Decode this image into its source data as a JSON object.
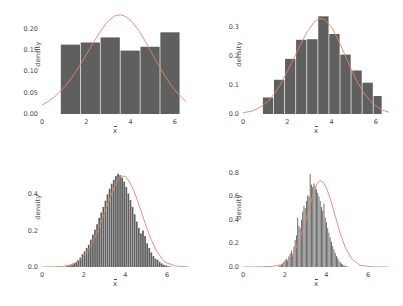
{
  "figure": {
    "background_color": "#ffffff",
    "bar_color": "#5f5f5f",
    "curve_color": "#e8836b",
    "text_color": "#4a4a4a",
    "panel_count": 4
  },
  "chart_data": [
    {
      "type": "bar",
      "panel": "top-left",
      "title": "",
      "subtitle": "",
      "xlabel": "x̄",
      "ylabel": "density",
      "grid": false,
      "legend": null,
      "xlim": [
        0,
        6.6
      ],
      "ylim": [
        0,
        0.235
      ],
      "xticks": [
        0,
        2,
        4,
        6
      ],
      "xticklabels": [
        "0",
        "2",
        "4",
        "6"
      ],
      "yticks": [
        0.0,
        0.05,
        0.1,
        0.15,
        0.2
      ],
      "yticklabels": [
        "0.00",
        "0.05",
        "0.10",
        "0.15",
        "0.20"
      ],
      "bin_edges": [
        0.85,
        1.75,
        2.65,
        3.55,
        4.45,
        5.35,
        6.25
      ],
      "values": [
        0.163,
        0.168,
        0.18,
        0.149,
        0.158,
        0.192
      ],
      "series": [
        {
          "name": "normal density curve",
          "type": "line",
          "x": [
            0.0,
            0.3,
            0.6,
            0.9,
            1.2,
            1.5,
            1.8,
            2.1,
            2.4,
            2.7,
            3.0,
            3.3,
            3.55,
            3.8,
            4.1,
            4.4,
            4.7,
            5.0,
            5.3,
            5.6,
            5.9,
            6.2,
            6.5
          ],
          "y": [
            0.021,
            0.03,
            0.042,
            0.057,
            0.075,
            0.097,
            0.122,
            0.148,
            0.174,
            0.199,
            0.219,
            0.231,
            0.233,
            0.229,
            0.215,
            0.194,
            0.168,
            0.14,
            0.112,
            0.086,
            0.063,
            0.045,
            0.03
          ]
        }
      ]
    },
    {
      "type": "bar",
      "panel": "top-right",
      "title": "",
      "subtitle": "",
      "xlabel": "x̄",
      "ylabel": "density",
      "grid": false,
      "legend": null,
      "xlim": [
        0,
        6.6
      ],
      "ylim": [
        0,
        0.345
      ],
      "xticks": [
        0,
        2,
        4,
        6
      ],
      "xticklabels": [
        "0",
        "2",
        "4",
        "6"
      ],
      "yticks": [
        0.0,
        0.1,
        0.2,
        0.3
      ],
      "yticklabels": [
        "0.0",
        "0.1",
        "0.2",
        "0.3"
      ],
      "bin_edges": [
        0.9,
        1.4,
        1.9,
        2.4,
        2.9,
        3.4,
        3.9,
        4.4,
        4.9,
        5.4,
        5.9,
        6.3
      ],
      "values": [
        0.057,
        0.118,
        0.19,
        0.256,
        0.258,
        0.337,
        0.276,
        0.205,
        0.15,
        0.108,
        0.062
      ],
      "series": [
        {
          "name": "normal density curve",
          "type": "line",
          "x": [
            0.0,
            0.4,
            0.8,
            1.1,
            1.4,
            1.7,
            2.0,
            2.3,
            2.6,
            2.9,
            3.2,
            3.45,
            3.7,
            4.0,
            4.3,
            4.6,
            4.9,
            5.2,
            5.5,
            5.9,
            6.3,
            6.6
          ],
          "y": [
            0.004,
            0.01,
            0.024,
            0.042,
            0.068,
            0.103,
            0.146,
            0.193,
            0.24,
            0.283,
            0.316,
            0.33,
            0.326,
            0.3,
            0.256,
            0.205,
            0.153,
            0.106,
            0.069,
            0.033,
            0.013,
            0.006
          ]
        }
      ]
    },
    {
      "type": "bar",
      "panel": "bottom-left",
      "title": "",
      "subtitle": "",
      "xlabel": "x̄",
      "ylabel": "density",
      "grid": false,
      "legend": null,
      "xlim": [
        0,
        7.0
      ],
      "ylim": [
        0,
        0.55
      ],
      "xticks": [
        0,
        2,
        4,
        6
      ],
      "xticklabels": [
        "0",
        "2",
        "4",
        "6"
      ],
      "yticks": [
        0.0,
        0.2,
        0.4
      ],
      "yticklabels": [
        "0.0",
        "0.2",
        "0.4"
      ],
      "bin_width": 0.1,
      "bin_start": 1.1,
      "values": [
        0.004,
        0.006,
        0.009,
        0.013,
        0.02,
        0.027,
        0.038,
        0.052,
        0.07,
        0.086,
        0.105,
        0.122,
        0.15,
        0.178,
        0.205,
        0.235,
        0.27,
        0.3,
        0.33,
        0.365,
        0.4,
        0.43,
        0.458,
        0.48,
        0.5,
        0.512,
        0.505,
        0.492,
        0.47,
        0.44,
        0.405,
        0.368,
        0.33,
        0.29,
        0.25,
        0.215,
        0.185,
        0.2,
        0.17,
        0.13,
        0.105,
        0.08,
        0.06,
        0.046,
        0.04,
        0.028,
        0.019,
        0.012,
        0.008,
        0.005,
        0.003
      ],
      "series": [
        {
          "name": "normal density curve",
          "type": "line",
          "x": [
            0.0,
            0.6,
            1.0,
            1.3,
            1.6,
            1.9,
            2.1,
            2.3,
            2.5,
            2.7,
            2.9,
            3.1,
            3.3,
            3.5,
            3.65,
            3.8,
            4.0,
            4.2,
            4.4,
            4.6,
            4.8,
            5.0,
            5.2,
            5.5,
            5.9,
            6.4,
            7.0
          ],
          "y": [
            0.0,
            0.001,
            0.004,
            0.01,
            0.023,
            0.047,
            0.073,
            0.108,
            0.152,
            0.206,
            0.266,
            0.33,
            0.39,
            0.448,
            0.482,
            0.5,
            0.498,
            0.468,
            0.42,
            0.358,
            0.29,
            0.222,
            0.16,
            0.086,
            0.026,
            0.005,
            0.001
          ]
        }
      ]
    },
    {
      "type": "bar",
      "panel": "bottom-right",
      "title": "",
      "subtitle": "",
      "xlabel": "x̄",
      "ylabel": "density",
      "grid": false,
      "legend": null,
      "xlim": [
        0,
        7.0
      ],
      "ylim": [
        0,
        0.85
      ],
      "xticks": [
        0,
        2,
        4,
        6
      ],
      "xticklabels": [
        "0",
        "2",
        "4",
        "6"
      ],
      "yticks": [
        0.0,
        0.2,
        0.4,
        0.6,
        0.8
      ],
      "yticklabels": [
        "0.0",
        "0.2",
        "0.4",
        "0.6",
        "0.8"
      ],
      "bin_width": 0.06,
      "bin_start": 1.7,
      "values": [
        0.01,
        0.014,
        0.02,
        0.03,
        0.045,
        0.06,
        0.072,
        0.055,
        0.09,
        0.115,
        0.14,
        0.1,
        0.175,
        0.23,
        0.27,
        0.42,
        0.35,
        0.33,
        0.4,
        0.47,
        0.52,
        0.5,
        0.56,
        0.61,
        0.6,
        0.79,
        0.7,
        0.68,
        0.71,
        0.69,
        0.66,
        0.63,
        0.6,
        0.56,
        0.51,
        0.48,
        0.54,
        0.42,
        0.38,
        0.33,
        0.29,
        0.25,
        0.215,
        0.18,
        0.15,
        0.12,
        0.095,
        0.075,
        0.055,
        0.04,
        0.03,
        0.022,
        0.016,
        0.01,
        0.006,
        0.004
      ],
      "series": [
        {
          "name": "normal density curve",
          "type": "line",
          "x": [
            0.0,
            0.8,
            1.4,
            1.8,
            2.1,
            2.35,
            2.55,
            2.75,
            2.95,
            3.1,
            3.25,
            3.4,
            3.55,
            3.7,
            3.85,
            4.0,
            4.15,
            4.3,
            4.5,
            4.7,
            4.9,
            5.2,
            5.6,
            6.2,
            7.0
          ],
          "y": [
            0.0,
            0.001,
            0.005,
            0.018,
            0.048,
            0.098,
            0.165,
            0.255,
            0.36,
            0.455,
            0.55,
            0.64,
            0.71,
            0.735,
            0.72,
            0.672,
            0.598,
            0.51,
            0.385,
            0.265,
            0.168,
            0.072,
            0.015,
            0.001,
            0.0
          ]
        }
      ]
    }
  ]
}
